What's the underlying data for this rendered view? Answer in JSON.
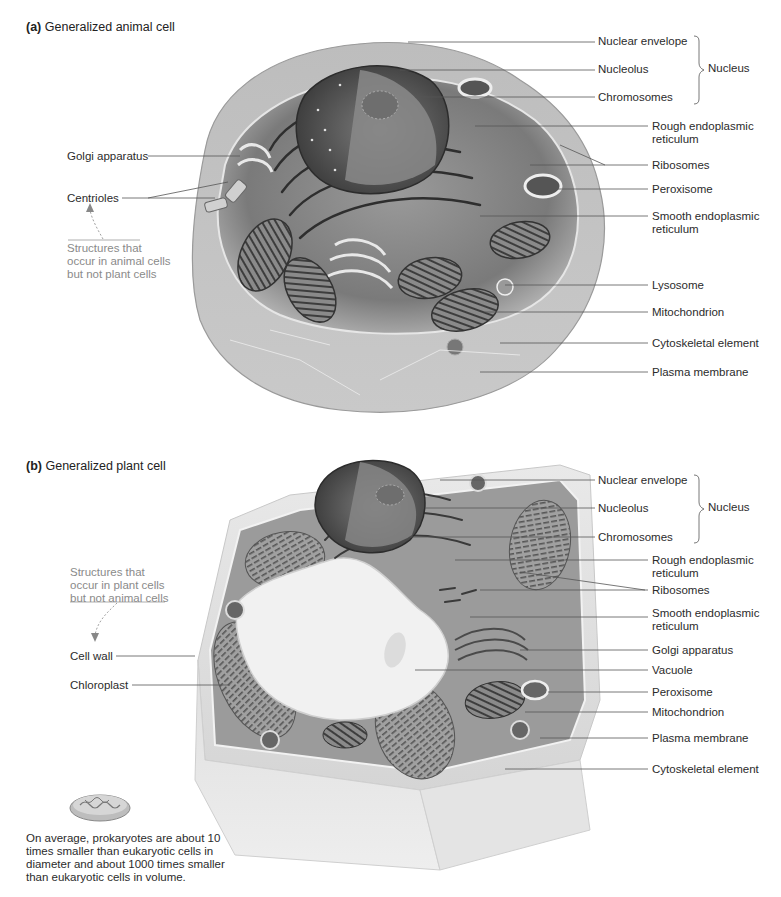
{
  "figure": {
    "panel_a": {
      "letter": "(a)",
      "title": "Generalized animal cell",
      "right_labels": [
        {
          "id": "nuclear-envelope",
          "text": "Nuclear envelope"
        },
        {
          "id": "nucleolus",
          "text": "Nucleolus"
        },
        {
          "id": "chromosomes",
          "text": "Chromosomes"
        },
        {
          "id": "rough-er",
          "text": "Rough endoplasmic\nreticulum"
        },
        {
          "id": "ribosomes",
          "text": "Ribosomes"
        },
        {
          "id": "peroxisome",
          "text": "Peroxisome"
        },
        {
          "id": "smooth-er",
          "text": "Smooth endoplasmic\nreticulum"
        },
        {
          "id": "lysosome",
          "text": "Lysosome"
        },
        {
          "id": "mitochondrion",
          "text": "Mitochondrion"
        },
        {
          "id": "cytoskeletal-element",
          "text": "Cytoskeletal element"
        },
        {
          "id": "plasma-membrane",
          "text": "Plasma membrane"
        }
      ],
      "nucleus_brace_label": "Nucleus",
      "left_labels": [
        {
          "id": "golgi-apparatus",
          "text": "Golgi apparatus"
        },
        {
          "id": "centrioles",
          "text": "Centrioles"
        }
      ],
      "unique_note": "Structures that\noccur in animal cells\nbut not plant cells"
    },
    "panel_b": {
      "letter": "(b)",
      "title": "Generalized plant cell",
      "right_labels": [
        {
          "id": "nuclear-envelope",
          "text": "Nuclear envelope"
        },
        {
          "id": "nucleolus",
          "text": "Nucleolus"
        },
        {
          "id": "chromosomes",
          "text": "Chromosomes"
        },
        {
          "id": "rough-er",
          "text": "Rough endoplasmic\nreticulum"
        },
        {
          "id": "ribosomes",
          "text": "Ribosomes"
        },
        {
          "id": "smooth-er",
          "text": "Smooth endoplasmic\nreticulum"
        },
        {
          "id": "golgi-apparatus",
          "text": "Golgi apparatus"
        },
        {
          "id": "vacuole",
          "text": "Vacuole"
        },
        {
          "id": "peroxisome",
          "text": "Peroxisome"
        },
        {
          "id": "mitochondrion",
          "text": "Mitochondrion"
        },
        {
          "id": "plasma-membrane",
          "text": "Plasma membrane"
        },
        {
          "id": "cytoskeletal-element",
          "text": "Cytoskeletal element"
        }
      ],
      "nucleus_brace_label": "Nucleus",
      "left_labels": [
        {
          "id": "cell-wall",
          "text": "Cell wall"
        },
        {
          "id": "chloroplast",
          "text": "Chloroplast"
        }
      ],
      "unique_note": "Structures that\noccur in plant cells\nbut not animal cells"
    },
    "prokaryote_caption": "On average, prokaryotes are about 10\ntimes smaller than eukaryotic cells in\ndiameter and about 1000 times smaller\nthan eukaryotic cells in volume.",
    "colors": {
      "label_text": "#2b2b2b",
      "note_text": "#8a8a8a",
      "leader_line": "#555555",
      "cell_dark": "#4a4a4a",
      "cell_mid": "#8c8c8c",
      "cell_light": "#d8d8d8"
    }
  }
}
